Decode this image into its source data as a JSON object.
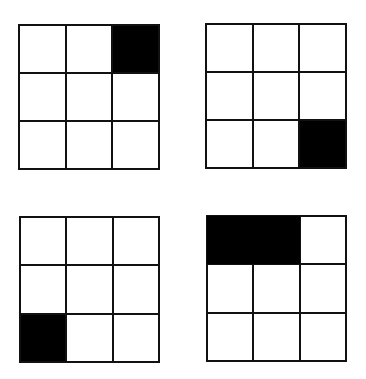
{
  "diagram": {
    "colors": {
      "filled": "#000000",
      "empty": "#ffffff",
      "line": "#111111"
    },
    "grids": [
      {
        "id": "top-left",
        "rows": 3,
        "cols": 3,
        "filled": [
          [
            0,
            2
          ]
        ]
      },
      {
        "id": "top-right",
        "rows": 3,
        "cols": 3,
        "filled": [
          [
            2,
            2
          ]
        ]
      },
      {
        "id": "bottom-left",
        "rows": 3,
        "cols": 3,
        "filled": [
          [
            2,
            0
          ]
        ]
      },
      {
        "id": "bottom-right",
        "rows": 3,
        "cols": 3,
        "filled": [
          [
            0,
            0
          ],
          [
            0,
            1
          ]
        ],
        "merged_filled": true
      }
    ]
  }
}
